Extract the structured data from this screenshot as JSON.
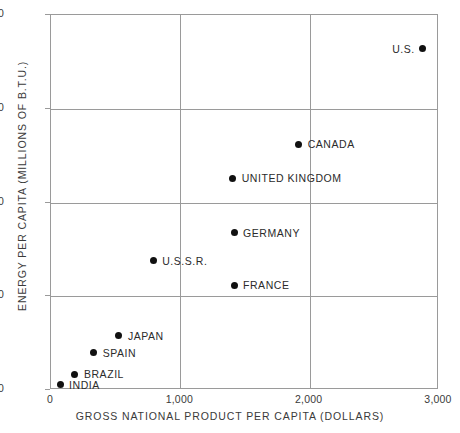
{
  "chart_data": {
    "type": "scatter",
    "title": "",
    "xlabel": "GROSS NATIONAL PRODUCT PER CAPITA (DOLLARS)",
    "ylabel": "ENERGY PER CAPITA (MILLIONS OF B.T.U.)",
    "xlim": [
      0,
      3000
    ],
    "ylim": [
      0,
      200
    ],
    "xticks": [
      0,
      1000,
      2000,
      3000
    ],
    "xtick_labels": [
      "0",
      "1,000",
      "2,000",
      "3,000"
    ],
    "yticks": [
      0,
      50,
      100,
      150,
      200
    ],
    "ytick_labels": [
      "0",
      "50",
      "100",
      "150",
      "200"
    ],
    "grid": true,
    "legend": "none",
    "marker_color": "#111111",
    "axis_color": "#9a9a9a",
    "points": [
      {
        "label": "U.S.",
        "x": 2875,
        "y": 182,
        "label_side": "left"
      },
      {
        "label": "CANADA",
        "x": 1915,
        "y": 131,
        "label_side": "right"
      },
      {
        "label": "UNITED KINGDOM",
        "x": 1405,
        "y": 113,
        "label_side": "right"
      },
      {
        "label": "GERMANY",
        "x": 1415,
        "y": 84,
        "label_side": "right"
      },
      {
        "label": "U.S.S.R.",
        "x": 790,
        "y": 69,
        "label_side": "right"
      },
      {
        "label": "FRANCE",
        "x": 1415,
        "y": 56,
        "label_side": "right"
      },
      {
        "label": "JAPAN",
        "x": 525,
        "y": 29,
        "label_side": "right"
      },
      {
        "label": "SPAIN",
        "x": 330,
        "y": 20,
        "label_side": "right"
      },
      {
        "label": "BRAZIL",
        "x": 185,
        "y": 8.5,
        "label_side": "right"
      },
      {
        "label": "INDIA",
        "x": 70,
        "y": 2.7,
        "label_side": "right"
      }
    ]
  }
}
